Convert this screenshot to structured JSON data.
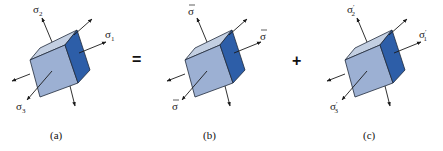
{
  "diagram": {
    "colors": {
      "top_face": "#c3cfe2",
      "front_face": "#9cb0d3",
      "right_face": "#2d5ea8",
      "edge": "#1f2a3a",
      "arrow": "#1a1a1a"
    },
    "operators": {
      "equals": "=",
      "plus": "+"
    },
    "panels": [
      {
        "caption": "(a)",
        "offset_x": 0,
        "labels": {
          "top": {
            "base": "σ",
            "sub": "2",
            "bar": false,
            "prime": false
          },
          "right": {
            "base": "σ",
            "sub": "1",
            "bar": false,
            "prime": false
          },
          "front": {
            "base": "σ",
            "sub": "3",
            "bar": false,
            "prime": false
          }
        }
      },
      {
        "caption": "(b)",
        "offset_x": 155,
        "labels": {
          "top": {
            "base": "σ",
            "sub": "",
            "bar": true,
            "prime": false
          },
          "right": {
            "base": "σ",
            "sub": "",
            "bar": true,
            "prime": false
          },
          "front": {
            "base": "σ",
            "sub": "",
            "bar": true,
            "prime": false
          }
        }
      },
      {
        "caption": "(c)",
        "offset_x": 315,
        "labels": {
          "top": {
            "base": "σ",
            "sub": "2",
            "bar": false,
            "prime": true
          },
          "right": {
            "base": "σ",
            "sub": "1",
            "bar": false,
            "prime": true
          },
          "front": {
            "base": "σ",
            "sub": "3",
            "bar": false,
            "prime": true
          }
        }
      }
    ]
  }
}
